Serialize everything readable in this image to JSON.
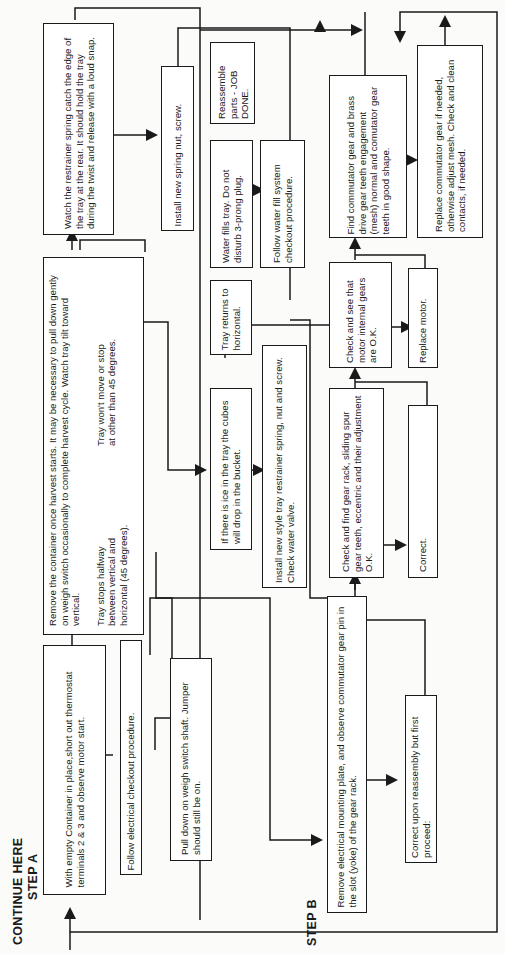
{
  "headings": {
    "continue": "CONTINUE HERE",
    "step_a": "STEP A",
    "step_b": "STEP B"
  },
  "boxes": {
    "step_a_start": "With empty Container in place,short out thermostat terminals 2 & 3 and observe motor start.",
    "electrical_checkout": "Follow electrical checkout procedure.",
    "pull_down": "Pull down on weigh  switch shaft. Jumper should still be on.",
    "remove_container": "Remove the container once harvest starts. It may be necessary to pull down gently on weigh switch occasionally to complete harvest cycle. Watch tray tilt toward vertical.",
    "tray_halfway": "Tray stops halfway between vertical and horizontal (45 degrees).",
    "tray_wont_move": "Tray won't move or stop at other than 45 degrees.",
    "watch_spring": "Watch the restrainer spring catch the edge of the tray at the rear. It should hold the tray during the twist and release with a loud snap.",
    "install_spring_nut": "Install new spring nut, screw.",
    "reassemble": "Reassemble parts - JOB DONE.",
    "water_fills": "Water fills tray. Do not disturb 3-prong plug.",
    "water_fill_checkout": "Follow water fill system checkout procedure.",
    "tray_returns": "Tray returns to horizontal.",
    "ice_in_tray": "If there is ice in the tray the cubes will drop in the bucket.",
    "install_restrainer": "Install new style tray restrainer spring, nut and screw. Check water valve.",
    "step_b_start": "Remove electrical mounting plate, and observe commutator gear pin in the slot (yoke) of the gear rack.",
    "correct_upon_reassembly": "Correct upon reassembly but first proceed:",
    "check_gear_rack": "Check and find gear rack, sliding spur gear teeth, eccentric and their adjustment O.K.",
    "correct": "Correct.",
    "check_motor_gears": "Check and see that motor internal gears are O.K.",
    "replace_motor": "Replace motor.",
    "find_commutator": "Find commutator gear and brass drive gear teeth engagement (mesh) normal and comutator gear teeth in good shape.",
    "replace_commutator": "Replace commutator gear if needed, otherwise adjust mesh. Check and clean contacts, if needed."
  },
  "colors": {
    "ink": "#1a1a1a",
    "paper": "#fbfbfa"
  }
}
